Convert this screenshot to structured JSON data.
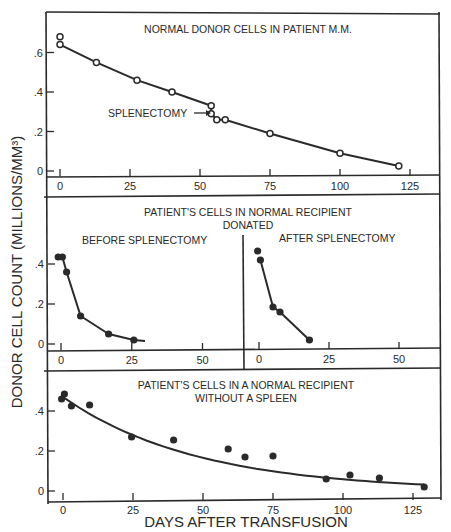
{
  "ylabel": "DONOR CELL COUNT (MILLIONS/MM³)",
  "xlabel": "DAYS AFTER TRANSFUSION",
  "panels": {
    "top": {
      "title": "NORMAL DONOR CELLS IN PATIENT M.M.",
      "annotation": "SPLENECTOMY"
    },
    "middle": {
      "title_line1": "PATIENT'S CELLS IN NORMAL RECIPIENT",
      "title_line2": "DONATED",
      "left_label": "BEFORE SPLENECTOMY",
      "right_label": "AFTER SPLENECTOMY"
    },
    "bottom": {
      "title_line1": "PATIENT'S CELLS IN A NORMAL RECIPIENT",
      "title_line2": "WITHOUT A SPLEEN"
    }
  },
  "ticks": {
    "y_top": [
      ".6",
      ".4",
      ".2",
      "0"
    ],
    "y_mid": [
      ".4",
      ".2",
      "0"
    ],
    "y_bot": [
      ".4",
      ".2",
      "0"
    ],
    "x_long": [
      "0",
      "25",
      "50",
      "75",
      "100",
      "125"
    ],
    "x_short": [
      "0",
      "25",
      "50"
    ]
  },
  "chart_data": [
    {
      "type": "line",
      "title": "NORMAL DONOR CELLS IN PATIENT M.M.",
      "xlabel": "DAYS AFTER TRANSFUSION",
      "ylabel": "DONOR CELL COUNT (MILLIONS/MM³)",
      "marker": "open-circle",
      "x": [
        0,
        0,
        13,
        27.5,
        40,
        54,
        54,
        56,
        59,
        75,
        100,
        121
      ],
      "y": [
        0.64,
        0.68,
        0.55,
        0.46,
        0.4,
        0.33,
        0.29,
        0.26,
        0.26,
        0.19,
        0.09,
        0.025
      ],
      "annotations": [
        {
          "text": "SPLENECTOMY",
          "x": 54,
          "y": 0.29
        }
      ],
      "xlim": [
        -3,
        135
      ],
      "ylim": [
        -0.03,
        0.72
      ],
      "xticks": [
        0,
        25,
        50,
        75,
        100,
        125
      ],
      "yticks": [
        0,
        0.2,
        0.4,
        0.6
      ],
      "grid": false
    },
    {
      "type": "line",
      "title": "PATIENT'S CELLS IN NORMAL RECIPIENT DONATED — BEFORE SPLENECTOMY",
      "marker": "filled-circle",
      "x": [
        -1,
        0.5,
        2,
        7,
        17,
        26
      ],
      "y": [
        0.435,
        0.435,
        0.36,
        0.14,
        0.05,
        0.02
      ],
      "xlim": [
        -3,
        65
      ],
      "ylim": [
        -0.03,
        0.5
      ],
      "xticks": [
        0,
        25,
        50
      ],
      "yticks": [
        0,
        0.2,
        0.4
      ],
      "grid": false
    },
    {
      "type": "line",
      "title": "PATIENT'S CELLS IN NORMAL RECIPIENT DONATED — AFTER SPLENECTOMY",
      "marker": "filled-circle",
      "x": [
        -0.5,
        0.5,
        5,
        7.5,
        18
      ],
      "y": [
        0.46,
        0.415,
        0.18,
        0.155,
        0.015
      ],
      "xlim": [
        -5,
        65
      ],
      "ylim": [
        -0.03,
        0.5
      ],
      "xticks": [
        0,
        25,
        50
      ],
      "grid": false
    },
    {
      "type": "scatter",
      "title": "PATIENT'S CELLS IN A NORMAL RECIPIENT WITHOUT A SPLEEN",
      "xlabel": "DAYS AFTER TRANSFUSION",
      "marker": "filled-circle",
      "x": [
        -0.5,
        0.5,
        3,
        9.5,
        24.5,
        39.5,
        59,
        65,
        75,
        94,
        102.5,
        113,
        129
      ],
      "y": [
        0.46,
        0.485,
        0.425,
        0.43,
        0.27,
        0.255,
        0.21,
        0.17,
        0.175,
        0.06,
        0.08,
        0.065,
        0.02
      ],
      "fit_curve": true,
      "xlim": [
        -3,
        135
      ],
      "ylim": [
        -0.03,
        0.5
      ],
      "xticks": [
        0,
        25,
        50,
        75,
        100,
        125
      ],
      "yticks": [
        0,
        0.2,
        0.4
      ],
      "grid": false
    }
  ]
}
